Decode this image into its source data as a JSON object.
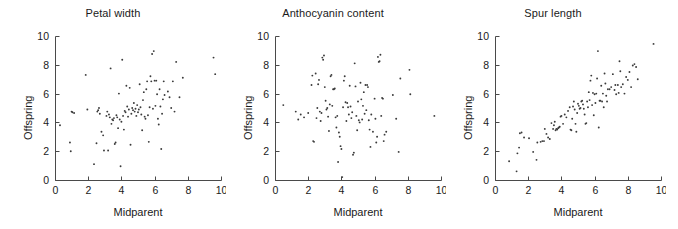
{
  "figure": {
    "background": "#ffffff",
    "point_color": "#3a3a3a",
    "axis_color": "#4a4a4a"
  },
  "panels": [
    {
      "title": "Petal width",
      "xlabel": "Midparent",
      "ylabel": "Offspring"
    },
    {
      "title": "Anthocyanin content",
      "xlabel": "Midparent",
      "ylabel": "Offspring"
    },
    {
      "title": "Spur length",
      "xlabel": "Midparent",
      "ylabel": "Offspring"
    }
  ],
  "ticks": {
    "x": [
      "0",
      "2",
      "4",
      "6",
      "8",
      "10"
    ],
    "y": [
      "0",
      "2",
      "4",
      "6",
      "8",
      "10"
    ]
  },
  "chart_data": [
    {
      "type": "scatter",
      "title": "Petal width",
      "xlabel": "Midparent",
      "ylabel": "Offspring",
      "xlim": [
        0,
        10
      ],
      "ylim": [
        0,
        10
      ],
      "xticks": [
        0,
        2,
        4,
        6,
        8,
        10
      ],
      "yticks": [
        0,
        2,
        4,
        6,
        8,
        10
      ],
      "grid": false,
      "legend": null,
      "points": [
        [
          0.3,
          3.8
        ],
        [
          0.9,
          2.6
        ],
        [
          0.95,
          2.0
        ],
        [
          1.0,
          4.75
        ],
        [
          1.05,
          4.7
        ],
        [
          1.15,
          4.65
        ],
        [
          1.85,
          7.3
        ],
        [
          1.95,
          4.9
        ],
        [
          2.35,
          1.1
        ],
        [
          2.5,
          2.55
        ],
        [
          2.55,
          4.75
        ],
        [
          2.6,
          4.85
        ],
        [
          2.65,
          5.0
        ],
        [
          2.7,
          4.6
        ],
        [
          2.8,
          3.35
        ],
        [
          2.9,
          3.1
        ],
        [
          2.95,
          2.05
        ],
        [
          3.1,
          4.45
        ],
        [
          3.15,
          4.75
        ],
        [
          3.2,
          2.05
        ],
        [
          3.25,
          4.55
        ],
        [
          3.3,
          4.35
        ],
        [
          3.35,
          7.75
        ],
        [
          3.4,
          3.9
        ],
        [
          3.45,
          4.2
        ],
        [
          3.5,
          4.15
        ],
        [
          3.55,
          4.3
        ],
        [
          3.6,
          2.5
        ],
        [
          3.65,
          2.6
        ],
        [
          3.7,
          4.5
        ],
        [
          3.75,
          4.35
        ],
        [
          3.8,
          3.6
        ],
        [
          3.85,
          6.0
        ],
        [
          3.9,
          4.2
        ],
        [
          3.95,
          0.95
        ],
        [
          4.0,
          4.05
        ],
        [
          4.05,
          8.35
        ],
        [
          4.1,
          4.45
        ],
        [
          4.15,
          3.5
        ],
        [
          4.2,
          4.8
        ],
        [
          4.25,
          4.7
        ],
        [
          4.3,
          6.55
        ],
        [
          4.35,
          5.1
        ],
        [
          4.4,
          4.4
        ],
        [
          4.45,
          4.9
        ],
        [
          4.5,
          6.4
        ],
        [
          4.55,
          2.45
        ],
        [
          4.6,
          4.6
        ],
        [
          4.65,
          5.0
        ],
        [
          4.7,
          4.85
        ],
        [
          4.75,
          5.35
        ],
        [
          4.8,
          4.75
        ],
        [
          4.85,
          4.95
        ],
        [
          4.9,
          4.45
        ],
        [
          4.95,
          5.2
        ],
        [
          5.0,
          4.7
        ],
        [
          5.05,
          4.9
        ],
        [
          5.1,
          6.65
        ],
        [
          5.15,
          5.05
        ],
        [
          5.2,
          4.55
        ],
        [
          5.25,
          3.45
        ],
        [
          5.3,
          5.55
        ],
        [
          5.35,
          6.1
        ],
        [
          5.4,
          4.4
        ],
        [
          5.45,
          4.25
        ],
        [
          5.5,
          6.3
        ],
        [
          5.55,
          6.85
        ],
        [
          5.6,
          4.5
        ],
        [
          5.65,
          2.65
        ],
        [
          5.7,
          5.05
        ],
        [
          5.75,
          7.2
        ],
        [
          5.8,
          6.85
        ],
        [
          5.85,
          8.75
        ],
        [
          5.9,
          4.95
        ],
        [
          5.95,
          8.95
        ],
        [
          6.0,
          6.9
        ],
        [
          6.05,
          5.15
        ],
        [
          6.1,
          6.9
        ],
        [
          6.15,
          5.95
        ],
        [
          6.2,
          4.25
        ],
        [
          6.25,
          3.85
        ],
        [
          6.3,
          6.3
        ],
        [
          6.35,
          5.1
        ],
        [
          6.4,
          2.15
        ],
        [
          6.45,
          4.6
        ],
        [
          6.5,
          5.6
        ],
        [
          6.55,
          6.85
        ],
        [
          6.6,
          5.9
        ],
        [
          6.8,
          6.15
        ],
        [
          6.9,
          5.75
        ],
        [
          7.0,
          5.0
        ],
        [
          7.1,
          6.85
        ],
        [
          7.2,
          4.75
        ],
        [
          7.3,
          8.2
        ],
        [
          7.5,
          5.75
        ],
        [
          7.7,
          7.1
        ],
        [
          9.55,
          8.5
        ],
        [
          9.65,
          7.35
        ]
      ]
    },
    {
      "type": "scatter",
      "title": "Anthocyanin content",
      "xlabel": "Midparent",
      "ylabel": "Offspring",
      "xlim": [
        0,
        10
      ],
      "ylim": [
        0,
        10
      ],
      "xticks": [
        0,
        2,
        4,
        6,
        8,
        10
      ],
      "yticks": [
        0,
        2,
        4,
        6,
        8,
        10
      ],
      "grid": false,
      "legend": null,
      "points": [
        [
          0.5,
          5.2
        ],
        [
          1.25,
          4.75
        ],
        [
          1.4,
          4.2
        ],
        [
          1.55,
          4.55
        ],
        [
          1.75,
          4.35
        ],
        [
          2.0,
          4.65
        ],
        [
          2.2,
          6.6
        ],
        [
          2.25,
          7.25
        ],
        [
          2.3,
          2.7
        ],
        [
          2.35,
          2.65
        ],
        [
          2.45,
          7.4
        ],
        [
          2.5,
          4.3
        ],
        [
          2.55,
          5.0
        ],
        [
          2.6,
          6.65
        ],
        [
          2.65,
          6.95
        ],
        [
          2.7,
          4.75
        ],
        [
          2.75,
          4.1
        ],
        [
          2.8,
          4.65
        ],
        [
          2.85,
          8.5
        ],
        [
          2.9,
          8.35
        ],
        [
          2.95,
          8.65
        ],
        [
          3.0,
          6.45
        ],
        [
          3.05,
          5.5
        ],
        [
          3.1,
          4.9
        ],
        [
          3.15,
          5.0
        ],
        [
          3.2,
          4.4
        ],
        [
          3.25,
          3.4
        ],
        [
          3.3,
          5.25
        ],
        [
          3.35,
          7.2
        ],
        [
          3.4,
          7.3
        ],
        [
          3.45,
          5.15
        ],
        [
          3.5,
          6.3
        ],
        [
          3.55,
          6.3
        ],
        [
          3.6,
          6.35
        ],
        [
          3.65,
          4.35
        ],
        [
          3.7,
          3.65
        ],
        [
          3.75,
          4.45
        ],
        [
          3.8,
          1.25
        ],
        [
          3.85,
          3.3
        ],
        [
          3.9,
          3.0
        ],
        [
          3.95,
          2.35
        ],
        [
          4.0,
          2.15
        ],
        [
          4.05,
          0.2
        ],
        [
          4.1,
          5.05
        ],
        [
          4.15,
          6.9
        ],
        [
          4.2,
          7.2
        ],
        [
          4.25,
          5.4
        ],
        [
          4.3,
          4.1
        ],
        [
          4.35,
          5.35
        ],
        [
          4.4,
          5.05
        ],
        [
          4.45,
          4.55
        ],
        [
          4.5,
          6.55
        ],
        [
          4.55,
          5.1
        ],
        [
          4.6,
          4.3
        ],
        [
          4.65,
          4.7
        ],
        [
          4.7,
          1.75
        ],
        [
          4.75,
          1.9
        ],
        [
          4.8,
          8.1
        ],
        [
          4.85,
          6.5
        ],
        [
          4.9,
          4.45
        ],
        [
          4.95,
          3.45
        ],
        [
          5.0,
          5.45
        ],
        [
          5.05,
          4.15
        ],
        [
          5.1,
          4.0
        ],
        [
          5.15,
          6.75
        ],
        [
          5.2,
          5.6
        ],
        [
          5.25,
          4.2
        ],
        [
          5.3,
          5.15
        ],
        [
          5.35,
          6.1
        ],
        [
          5.4,
          4.6
        ],
        [
          5.45,
          6.6
        ],
        [
          5.5,
          4.85
        ],
        [
          5.55,
          6.6
        ],
        [
          5.6,
          6.45
        ],
        [
          5.65,
          4.15
        ],
        [
          5.7,
          3.5
        ],
        [
          5.75,
          2.3
        ],
        [
          5.8,
          4.55
        ],
        [
          5.9,
          3.35
        ],
        [
          6.0,
          5.65
        ],
        [
          6.05,
          4.25
        ],
        [
          6.1,
          2.6
        ],
        [
          6.15,
          3.0
        ],
        [
          6.2,
          8.55
        ],
        [
          6.25,
          8.2
        ],
        [
          6.3,
          8.25
        ],
        [
          6.35,
          8.7
        ],
        [
          6.4,
          4.45
        ],
        [
          6.45,
          5.7
        ],
        [
          6.5,
          5.65
        ],
        [
          6.55,
          2.7
        ],
        [
          6.6,
          3.15
        ],
        [
          6.7,
          3.35
        ],
        [
          7.1,
          5.9
        ],
        [
          7.3,
          4.25
        ],
        [
          7.45,
          1.95
        ],
        [
          7.55,
          7.05
        ],
        [
          8.1,
          7.65
        ],
        [
          8.15,
          5.95
        ],
        [
          9.6,
          4.45
        ]
      ]
    },
    {
      "type": "scatter",
      "title": "Spur length",
      "xlabel": "Midparent",
      "ylabel": "Offspring",
      "xlim": [
        0,
        10
      ],
      "ylim": [
        0,
        10
      ],
      "xticks": [
        0,
        2,
        4,
        6,
        8,
        10
      ],
      "yticks": [
        0,
        2,
        4,
        6,
        8,
        10
      ],
      "grid": false,
      "legend": null,
      "points": [
        [
          0.85,
          1.3
        ],
        [
          1.3,
          0.6
        ],
        [
          1.35,
          1.85
        ],
        [
          1.45,
          2.25
        ],
        [
          1.5,
          3.25
        ],
        [
          1.6,
          3.3
        ],
        [
          1.75,
          2.95
        ],
        [
          2.05,
          2.9
        ],
        [
          2.3,
          1.95
        ],
        [
          2.5,
          1.4
        ],
        [
          2.55,
          2.6
        ],
        [
          2.75,
          2.65
        ],
        [
          2.85,
          2.7
        ],
        [
          2.95,
          2.7
        ],
        [
          3.0,
          3.55
        ],
        [
          3.1,
          3.2
        ],
        [
          3.2,
          2.95
        ],
        [
          3.3,
          2.85
        ],
        [
          3.4,
          3.95
        ],
        [
          3.5,
          3.55
        ],
        [
          3.55,
          3.8
        ],
        [
          3.6,
          4.05
        ],
        [
          3.65,
          3.45
        ],
        [
          3.7,
          3.55
        ],
        [
          3.75,
          3.5
        ],
        [
          3.8,
          3.6
        ],
        [
          3.85,
          3.65
        ],
        [
          3.9,
          3.7
        ],
        [
          3.95,
          4.4
        ],
        [
          4.0,
          4.45
        ],
        [
          4.1,
          3.9
        ],
        [
          4.2,
          4.55
        ],
        [
          4.3,
          4.35
        ],
        [
          4.4,
          4.8
        ],
        [
          4.5,
          5.05
        ],
        [
          4.55,
          3.5
        ],
        [
          4.6,
          3.45
        ],
        [
          4.65,
          4.25
        ],
        [
          4.7,
          5.1
        ],
        [
          4.75,
          5.45
        ],
        [
          4.8,
          4.9
        ],
        [
          4.85,
          3.9
        ],
        [
          4.9,
          3.35
        ],
        [
          4.95,
          4.65
        ],
        [
          5.0,
          5.3
        ],
        [
          5.05,
          5.15
        ],
        [
          5.1,
          4.95
        ],
        [
          5.15,
          5.0
        ],
        [
          5.2,
          5.45
        ],
        [
          5.25,
          5.5
        ],
        [
          5.3,
          5.25
        ],
        [
          5.35,
          4.95
        ],
        [
          5.4,
          4.55
        ],
        [
          5.45,
          3.9
        ],
        [
          5.5,
          3.95
        ],
        [
          5.55,
          5.45
        ],
        [
          5.6,
          5.05
        ],
        [
          5.65,
          6.1
        ],
        [
          5.7,
          5.55
        ],
        [
          5.75,
          6.9
        ],
        [
          5.8,
          7.25
        ],
        [
          5.85,
          5.2
        ],
        [
          5.9,
          6.05
        ],
        [
          5.95,
          4.5
        ],
        [
          6.0,
          5.95
        ],
        [
          6.05,
          5.35
        ],
        [
          6.1,
          6.0
        ],
        [
          6.15,
          7.05
        ],
        [
          6.2,
          8.95
        ],
        [
          6.25,
          3.65
        ],
        [
          6.3,
          5.5
        ],
        [
          6.35,
          5.5
        ],
        [
          6.4,
          6.55
        ],
        [
          6.45,
          5.45
        ],
        [
          6.5,
          6.0
        ],
        [
          6.55,
          5.05
        ],
        [
          6.6,
          7.4
        ],
        [
          6.65,
          6.7
        ],
        [
          6.7,
          5.85
        ],
        [
          6.75,
          5.45
        ],
        [
          6.8,
          6.3
        ],
        [
          6.9,
          6.3
        ],
        [
          7.0,
          6.45
        ],
        [
          7.1,
          7.35
        ],
        [
          7.2,
          6.25
        ],
        [
          7.25,
          6.6
        ],
        [
          7.3,
          5.95
        ],
        [
          7.4,
          6.6
        ],
        [
          7.45,
          6.05
        ],
        [
          7.5,
          8.25
        ],
        [
          7.55,
          7.55
        ],
        [
          7.6,
          6.45
        ],
        [
          7.7,
          6.65
        ],
        [
          7.8,
          6.0
        ],
        [
          7.9,
          7.15
        ],
        [
          8.0,
          6.95
        ],
        [
          8.1,
          7.5
        ],
        [
          8.2,
          6.45
        ],
        [
          8.3,
          7.95
        ],
        [
          8.4,
          8.05
        ],
        [
          8.5,
          7.85
        ],
        [
          8.6,
          7.0
        ],
        [
          9.55,
          9.45
        ]
      ]
    }
  ]
}
